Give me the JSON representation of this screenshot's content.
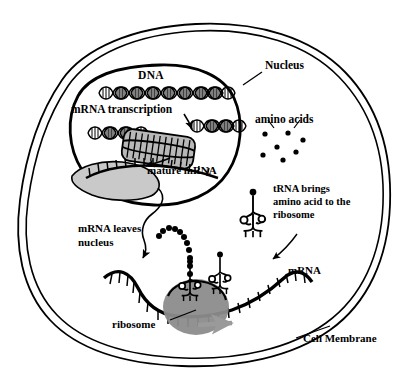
{
  "figure": {
    "background_color": "#ffffff",
    "ink_color": "#000000",
    "nucleolus_fill": "#c9c9c9",
    "ribosome_fill": "#8c8c8c",
    "bubble_fill": "#b8b8b8",
    "arrow_gray": "#9a9a9a"
  },
  "labels": {
    "nucleus": "Nucleus",
    "dna": "DNA",
    "mrna_transcription": "mRNA transcription",
    "mature_mrna": "mature mRNA",
    "amino_acids": "amino acids",
    "trna_line1": "tRNA brings",
    "trna_line2": "amino acid to the",
    "trna_line3": "ribosome",
    "mrna_leaves_line1": "mRNA leaves",
    "mrna_leaves_line2": "nucleus",
    "mrna": "mRNA",
    "ribosome": "ribosome",
    "cell_membrane": "Cell Membrane"
  },
  "structures": {
    "cell_membrane": {
      "name": "cell-membrane",
      "style": "double-line closed irregular outline",
      "description": "Outer boundary of the cell drawn as two parallel curves"
    },
    "nucleus": {
      "name": "nucleus-envelope",
      "style": "thick closed oval blob in upper-left quadrant"
    },
    "dna_helix": {
      "name": "dna-double-helix",
      "turns": 8,
      "position": "top of nucleus"
    },
    "transcription_bubble": {
      "name": "transcription-bubble",
      "description": "Opened DNA region with RNA polymerase, flanked by helix on both sides"
    },
    "nucleolus": {
      "name": "nucleolus",
      "description": "Gray crescent-shaped body in lower nucleus"
    },
    "mature_mrna_strand": {
      "name": "mature-mrna-strand",
      "description": "Comb-toothed strand leaving the nucleus"
    },
    "amino_acid_dots": {
      "name": "amino-acid-dots",
      "count": 7
    },
    "free_trna": {
      "name": "free-trna",
      "description": "Cloverleaf tRNA with attached amino acid dot, upper right"
    },
    "mrna_translation_strand": {
      "name": "mrna-translation-strand",
      "description": "Long wavy mRNA with codon ticks running across bottom of cell"
    },
    "ribosome_body": {
      "name": "ribosome",
      "description": "Gray oval straddling the mRNA strand"
    },
    "bound_trnas": {
      "name": "bound-trna",
      "count": 2
    },
    "polypeptide_chain": {
      "name": "polypeptide-chain",
      "beads": 11,
      "description": "Chain of dark beads rising out of the ribosome"
    },
    "direction_arrow": {
      "name": "ribosome-direction-arrow",
      "direction": "right",
      "color": "#9a9a9a"
    }
  },
  "leader_lines": [
    {
      "name": "nucleus-leader",
      "from": "Nucleus",
      "to": "nucleus envelope"
    },
    {
      "name": "transcription-arrow",
      "from": "mRNA transcription",
      "to": "transcription bubble"
    },
    {
      "name": "mature-mrna-arrow",
      "from": "transcription bubble",
      "to": "mature mRNA"
    },
    {
      "name": "mrna-leaves-arrow",
      "from": "nucleus",
      "to": "cytoplasm mRNA"
    },
    {
      "name": "trna-leader",
      "from": "tRNA brings amino acid to the ribosome",
      "to": "free tRNA"
    },
    {
      "name": "ribosome-leader",
      "from": "ribosome",
      "to": "ribosome body"
    },
    {
      "name": "membrane-leader",
      "from": "Cell Membrane",
      "to": "cell membrane"
    }
  ]
}
